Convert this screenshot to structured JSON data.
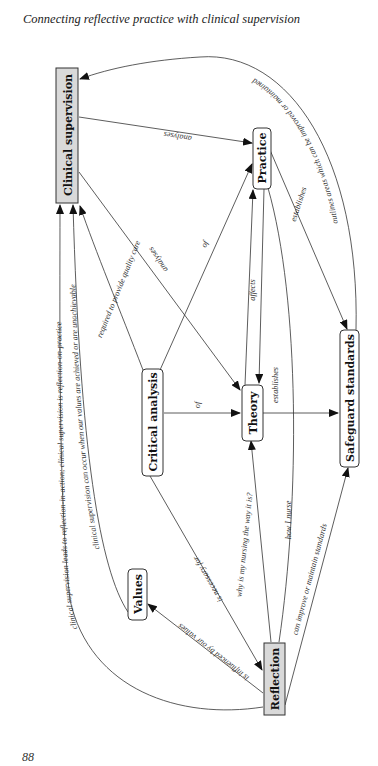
{
  "page": {
    "header": "Connecting reflective practice with clinical supervision",
    "page_number": "88"
  },
  "diagram": {
    "orientation": "rotated 90° counter-clockwise",
    "nodes": [
      {
        "id": "clinical_supervision",
        "label": "Clinical supervision",
        "shape": "rect",
        "fill": "#d9d9d9"
      },
      {
        "id": "practice",
        "label": "Practice",
        "shape": "rounded",
        "fill": "#ffffff"
      },
      {
        "id": "critical_analysis",
        "label": "Critical analysis",
        "shape": "rounded",
        "fill": "#ffffff"
      },
      {
        "id": "theory",
        "label": "Theory",
        "shape": "rounded",
        "fill": "#ffffff"
      },
      {
        "id": "safeguard_standards",
        "label": "Safeguard standards",
        "shape": "rounded",
        "fill": "#ffffff"
      },
      {
        "id": "values",
        "label": "Values",
        "shape": "rounded",
        "fill": "#ffffff"
      },
      {
        "id": "reflection",
        "label": "Reflection",
        "shape": "rect",
        "fill": "#d9d9d9"
      }
    ],
    "edges": [
      {
        "from": "clinical_supervision",
        "to": "practice",
        "label": "analyses"
      },
      {
        "from": "clinical_supervision",
        "to": "theory",
        "label": "analyses"
      },
      {
        "from": "critical_analysis",
        "to": "clinical_supervision",
        "label": "required to provide quality care"
      },
      {
        "from": "critical_analysis",
        "to": "practice",
        "label": "of"
      },
      {
        "from": "critical_analysis",
        "to": "theory",
        "label": "of"
      },
      {
        "from": "critical_analysis",
        "to": "reflection",
        "label": "is necessary for"
      },
      {
        "from": "practice",
        "to": "theory",
        "label": "affects"
      },
      {
        "from": "theory",
        "to": "practice",
        "label": ""
      },
      {
        "from": "practice",
        "to": "safeguard_standards",
        "label": "establishes"
      },
      {
        "from": "theory",
        "to": "safeguard_standards",
        "label": "establishes"
      },
      {
        "from": "safeguard_standards",
        "to": "clinical_supervision",
        "label": "outlines areas which can be improved or maintained"
      },
      {
        "from": "reflection",
        "to": "theory",
        "label": "why is my nursing the way it is?"
      },
      {
        "from": "reflection",
        "to": "practice",
        "label": "how I nurse"
      },
      {
        "from": "reflection",
        "to": "safeguard_standards",
        "label": "can improve or maintain standards"
      },
      {
        "from": "reflection",
        "to": "values",
        "label": "is influenced by our values"
      },
      {
        "from": "values",
        "to": "clinical_supervision",
        "label": "clinical supervision can occur when our values are achieved or are unachievable"
      },
      {
        "from": "reflection",
        "to": "clinical_supervision",
        "label": "clinical supervision leads to reflection-in-action; clinical supervision is reflection-on-practice"
      }
    ]
  }
}
